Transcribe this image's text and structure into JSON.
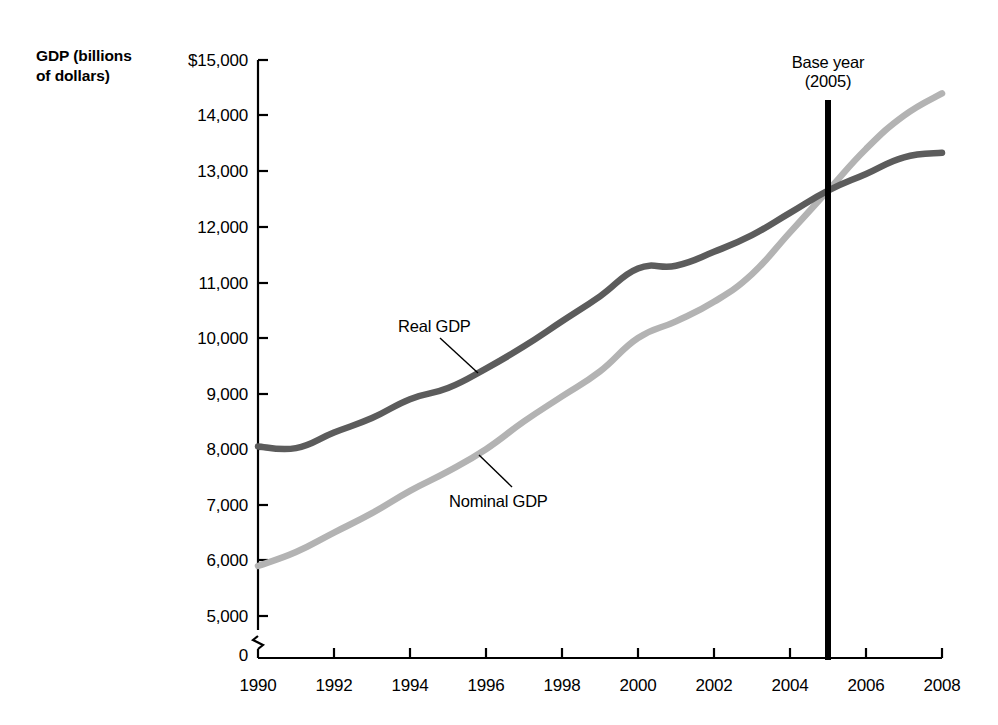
{
  "chart_data": {
    "type": "line",
    "title": "",
    "ylabel": "GDP (billions of dollars)",
    "xlabel": "",
    "ylim": [
      0,
      15000
    ],
    "xlim": [
      1990,
      2008
    ],
    "grid": false,
    "legend_position": "inline-annotations",
    "y_axis_break": true,
    "y_axis_break_note": "axis breaks between 0 and 5,000",
    "ytick_labels": [
      "$15,000",
      "14,000",
      "13,000",
      "12,000",
      "11,000",
      "10,000",
      "9,000",
      "8,000",
      "7,000",
      "6,000",
      "5,000",
      "0"
    ],
    "ytick_values": [
      15000,
      14000,
      13000,
      12000,
      11000,
      10000,
      9000,
      8000,
      7000,
      6000,
      5000,
      0
    ],
    "xtick_labels": [
      "1990",
      "1992",
      "1994",
      "1996",
      "1998",
      "2000",
      "2002",
      "2004",
      "2006",
      "2008"
    ],
    "xtick_values": [
      1990,
      1992,
      1994,
      1996,
      1998,
      2000,
      2002,
      2004,
      2006,
      2008
    ],
    "x": [
      1990,
      1991,
      1992,
      1993,
      1994,
      1995,
      1996,
      1997,
      1998,
      1999,
      2000,
      2001,
      2002,
      2003,
      2004,
      2005,
      2006,
      2007,
      2008
    ],
    "series": [
      {
        "name": "Real GDP",
        "color": "#5c5c5c",
        "values": [
          8050,
          8020,
          8300,
          8560,
          8900,
          9100,
          9450,
          9850,
          10300,
          10750,
          11250,
          11300,
          11550,
          11850,
          12250,
          12650,
          12950,
          13250,
          13330
        ]
      },
      {
        "name": "Nominal GDP",
        "color": "#b3b3b3",
        "values": [
          5900,
          6150,
          6500,
          6850,
          7250,
          7600,
          8000,
          8500,
          8950,
          9400,
          10000,
          10300,
          10650,
          11150,
          11900,
          12650,
          13400,
          14000,
          14400
        ]
      }
    ],
    "annotations": [
      {
        "id": "real-gdp-label",
        "text": "Real GDP",
        "series": "Real GDP"
      },
      {
        "id": "nominal-gdp-label",
        "text": "Nominal GDP",
        "series": "Nominal GDP"
      },
      {
        "id": "base-year-marker",
        "text_line1": "Base year",
        "text_line2": "(2005)",
        "x_value": 2005,
        "color": "#000000"
      }
    ]
  },
  "axis": {
    "y_title_line1": "GDP (billions",
    "y_title_line2": "of dollars)",
    "yticks": [
      {
        "label": "$15,000",
        "y": 60
      },
      {
        "label": "14,000",
        "y": 115
      },
      {
        "label": "13,000",
        "y": 171
      },
      {
        "label": "12,000",
        "y": 227
      },
      {
        "label": "11,000",
        "y": 283
      },
      {
        "label": "10,000",
        "y": 338
      },
      {
        "label": "9,000",
        "y": 394
      },
      {
        "label": "8,000",
        "y": 449
      },
      {
        "label": "7,000",
        "y": 505
      },
      {
        "label": "6,000",
        "y": 560
      },
      {
        "label": "5,000",
        "y": 616
      },
      {
        "label": "0",
        "y": 655
      }
    ],
    "xticks": [
      {
        "label": "1990",
        "x": 258
      },
      {
        "label": "1992",
        "x": 334
      },
      {
        "label": "1994",
        "x": 410
      },
      {
        "label": "1996",
        "x": 486
      },
      {
        "label": "1998",
        "x": 562
      },
      {
        "label": "2000",
        "x": 638
      },
      {
        "label": "2002",
        "x": 714
      },
      {
        "label": "2004",
        "x": 790
      },
      {
        "label": "2006",
        "x": 866
      },
      {
        "label": "2008",
        "x": 942
      }
    ]
  },
  "annotations": {
    "real_gdp": "Real GDP",
    "nominal_gdp": "Nominal GDP",
    "base_year_line1": "Base year",
    "base_year_line2": "(2005)"
  }
}
